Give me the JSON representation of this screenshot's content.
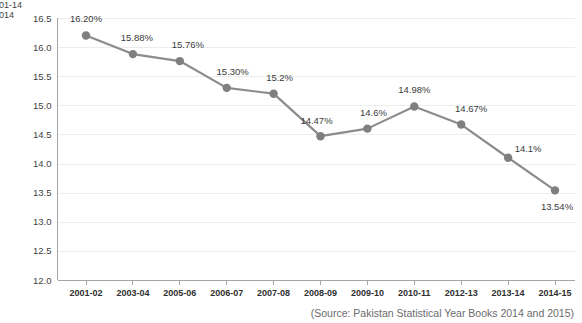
{
  "legend": {
    "title_truncated": "01-14",
    "series_truncated": "014",
    "marker_color": "#8c8c8c"
  },
  "source": {
    "note": "(Source: Pakistan Statistical Year Books 2014 and 2015)"
  },
  "chart_data": {
    "type": "line",
    "title": "",
    "xlabel": "",
    "ylabel": "",
    "ylim": [
      12.0,
      16.5
    ],
    "yticks": [
      "12.0",
      "12.5",
      "13.0",
      "13.5",
      "14.0",
      "14.5",
      "15.0",
      "15.5",
      "16.0",
      "16.5"
    ],
    "grid": true,
    "legend_position": "top-left",
    "categories": [
      "2001-02",
      "2003-04",
      "2005-06",
      "2006-07",
      "2007-08",
      "2008-09",
      "2009-10",
      "2010-11",
      "2012-13",
      "2013-14",
      "2014-15"
    ],
    "values": [
      16.2,
      15.88,
      15.76,
      15.3,
      15.2,
      14.47,
      14.6,
      14.98,
      14.67,
      14.1,
      13.54
    ],
    "data_labels": [
      "16.20%",
      "15.88%",
      "15.76%",
      "15.30%",
      "15.2%",
      "14.47%",
      "14.6%",
      "14.98%",
      "14.67%",
      "14.1%",
      "13.54%"
    ],
    "label_offsets": [
      {
        "dx": 0,
        "dy": -13
      },
      {
        "dx": 4,
        "dy": -13
      },
      {
        "dx": 8,
        "dy": -13
      },
      {
        "dx": 6,
        "dy": -13
      },
      {
        "dx": 6,
        "dy": -13
      },
      {
        "dx": -4,
        "dy": -12
      },
      {
        "dx": 6,
        "dy": -13
      },
      {
        "dx": 0,
        "dy": -13
      },
      {
        "dx": 10,
        "dy": -13
      },
      {
        "dx": 20,
        "dy": -6
      },
      {
        "dx": 2,
        "dy": 20
      }
    ],
    "series_color": "#8c8c8c",
    "marker_color": "#7f7f7f"
  }
}
